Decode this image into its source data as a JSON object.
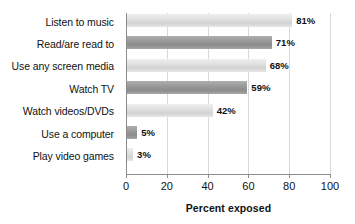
{
  "chart_data": {
    "type": "bar",
    "orientation": "horizontal",
    "title": "",
    "xlabel": "Percent exposed",
    "ylabel": "",
    "xlim": [
      0,
      100
    ],
    "xticks": [
      "0",
      "20",
      "40",
      "60",
      "80",
      "100"
    ],
    "grid": true,
    "legend": "none",
    "categories": [
      "Listen to music",
      "Read/are read to",
      "Use any screen media",
      "Watch TV",
      "Watch videos/DVDs",
      "Use a computer",
      "Play video games"
    ],
    "values": [
      81,
      71,
      68,
      59,
      42,
      5,
      3
    ],
    "value_labels": [
      "81%",
      "71%",
      "68%",
      "59%",
      "42%",
      "5%",
      "3%"
    ],
    "bar_shades": [
      "light",
      "dark",
      "light",
      "dark",
      "light",
      "dark",
      "light"
    ],
    "colors": {
      "bar_light": "#e2e2e2",
      "bar_dark": "#9b9b9b",
      "gridline": "#d9d9d9",
      "axis": "#8c8c8c",
      "text": "#111111",
      "background": "#ffffff"
    }
  }
}
